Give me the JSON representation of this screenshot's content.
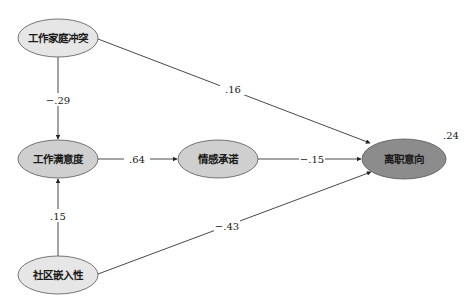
{
  "diagram": {
    "type": "path-model",
    "nodes": [
      {
        "id": "wfc",
        "label": "工作家庭冲突",
        "cx": 58,
        "cy": 38,
        "rx": 40,
        "ry": 19,
        "fill": "#e6e6e6"
      },
      {
        "id": "js",
        "label": "工作满意度",
        "cx": 58,
        "cy": 159,
        "rx": 40,
        "ry": 19,
        "fill": "#cfcfcf"
      },
      {
        "id": "ac",
        "label": "情感承诺",
        "cx": 218,
        "cy": 159,
        "rx": 40,
        "ry": 19,
        "fill": "#cfcfcf"
      },
      {
        "id": "ti",
        "label": "离职意向",
        "cx": 404,
        "cy": 159,
        "rx": 42,
        "ry": 20,
        "fill": "#8c8c8c"
      },
      {
        "id": "ce",
        "label": "社区嵌入性",
        "cx": 58,
        "cy": 275,
        "rx": 40,
        "ry": 19,
        "fill": "#e6e6e6"
      }
    ],
    "paths": [
      {
        "from": "wfc",
        "to": "js",
        "coef": "−.29",
        "x1": 58,
        "y1": 57,
        "x2": 58,
        "y2": 139,
        "lx": 58,
        "ly": 100
      },
      {
        "from": "ce",
        "to": "js",
        "coef": ".15",
        "x1": 58,
        "y1": 256,
        "x2": 58,
        "y2": 179,
        "lx": 58,
        "ly": 216
      },
      {
        "from": "js",
        "to": "ac",
        "coef": ".64",
        "x1": 98,
        "y1": 159,
        "x2": 177,
        "y2": 159,
        "lx": 137,
        "ly": 159
      },
      {
        "from": "ac",
        "to": "ti",
        "coef": "−.15",
        "x1": 258,
        "y1": 159,
        "x2": 361,
        "y2": 159,
        "lx": 312,
        "ly": 159
      },
      {
        "from": "wfc",
        "to": "ti",
        "coef": ".16",
        "x1": 98,
        "y1": 39,
        "x2": 370,
        "y2": 143,
        "lx": 233,
        "ly": 89
      },
      {
        "from": "ce",
        "to": "ti",
        "coef": "−.43",
        "x1": 98,
        "y1": 274,
        "x2": 371,
        "y2": 172,
        "lx": 227,
        "ly": 226
      }
    ],
    "r_squared": {
      "node": "ti",
      "value": ".24",
      "x": 443,
      "y": 139
    }
  }
}
